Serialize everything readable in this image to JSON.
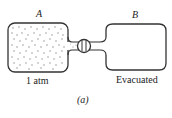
{
  "diagram": {
    "container_a": {
      "label": "A",
      "pressure_label": "1 atm",
      "state": "filled with gas"
    },
    "container_b": {
      "label": "B",
      "pressure_label": "Evacuated",
      "state": "empty"
    },
    "valve": {
      "state": "closed"
    },
    "caption": "(a)"
  },
  "colors": {
    "stroke": "#333333",
    "dots": "#777777",
    "background": "#ffffff"
  }
}
